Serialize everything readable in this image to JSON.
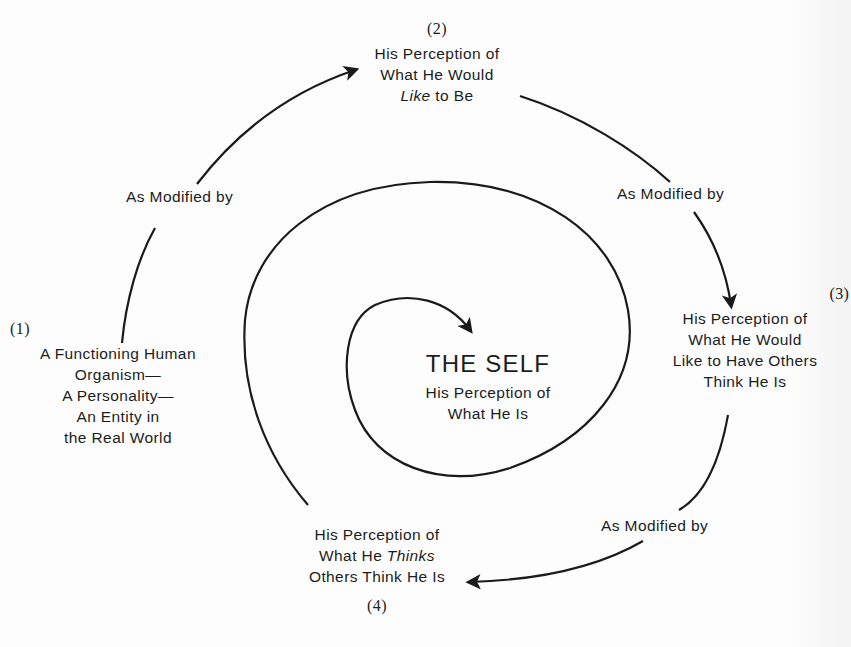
{
  "diagram": {
    "type": "spiral-flow",
    "center": {
      "title": "THE SELF",
      "line1": "His Perception of",
      "line2": "What He Is"
    },
    "nodes": [
      {
        "number": "(1)",
        "lines": [
          "A Functioning Human",
          "Organism—",
          "A Personality—",
          "An Entity in",
          "the Real World"
        ]
      },
      {
        "number": "(2)",
        "lines": [
          "His Perception of",
          "What He Would"
        ],
        "line3_italic": "Like",
        "line3_rest": " to Be"
      },
      {
        "number": "(3)",
        "lines": [
          "His Perception of",
          "What He Would",
          "Like to Have Others",
          "Think He Is"
        ]
      },
      {
        "number": "(4)",
        "line1": "His Perception of",
        "line2_pre": "What He ",
        "line2_italic": "Thinks",
        "line3": "Others Think He Is"
      }
    ],
    "edges": [
      {
        "from": "(1)",
        "to": "(2)",
        "label": "As Modified by"
      },
      {
        "from": "(2)",
        "to": "(3)",
        "label": "As Modified by"
      },
      {
        "from": "(3)",
        "to": "(4)",
        "label": "As Modified by"
      },
      {
        "from": "(4)",
        "to": "THE SELF",
        "label": ""
      }
    ],
    "colors": {
      "stroke": "#1a1a1a",
      "text": "#1c1c1c",
      "background": "#fdfdfd"
    }
  }
}
